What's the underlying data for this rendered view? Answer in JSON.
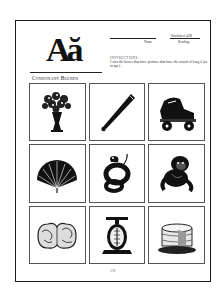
{
  "worksheet": {
    "logo_letters": "Aă",
    "logo_caption": "Consonant Blends",
    "header": {
      "name_label": "Name",
      "worksheet_label": "Worksheet 42B",
      "reading_label": "Reading"
    },
    "instructions": {
      "title": "INSTRUCTIONS:",
      "text": "Color the boxes that have pictures that have the sound of long A (as in ape)."
    },
    "pictures": [
      {
        "name": "flower-vase",
        "icon": "vase-of-flowers"
      },
      {
        "name": "baseball-bat",
        "icon": "bat"
      },
      {
        "name": "roller-skate",
        "icon": "skate"
      },
      {
        "name": "hand-fan",
        "icon": "fan"
      },
      {
        "name": "snake",
        "icon": "snake"
      },
      {
        "name": "ape",
        "icon": "ape"
      },
      {
        "name": "brain",
        "icon": "brain"
      },
      {
        "name": "scale",
        "icon": "scale"
      },
      {
        "name": "cake",
        "icon": "cake"
      }
    ],
    "page_number": "178"
  }
}
